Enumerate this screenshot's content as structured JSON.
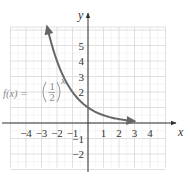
{
  "chart_data": {
    "type": "line",
    "title": "",
    "xlabel": "x",
    "ylabel": "y",
    "xlim": [
      -5,
      5
    ],
    "ylim": [
      -3,
      6
    ],
    "grid": true,
    "x_ticks": [
      -4,
      -3,
      -2,
      -1,
      1,
      2,
      3,
      4
    ],
    "x_tick_labels": [
      "−4",
      "−3",
      "−2",
      "−1",
      "1",
      "2",
      "3",
      "4"
    ],
    "y_ticks": [
      -2,
      -1,
      2,
      3,
      4,
      5
    ],
    "y_tick_labels": [
      "−2",
      "−1",
      "2",
      "3",
      "4",
      "5"
    ],
    "series": [
      {
        "name": "f(x) = (1/2)^x",
        "function": "(1/2)^x",
        "x": [
          -2.5,
          -2,
          -1.5,
          -1,
          -0.5,
          0,
          0.5,
          1,
          1.5,
          2,
          2.5,
          3
        ],
        "values": [
          5.66,
          4,
          2.83,
          2,
          1.41,
          1,
          0.71,
          0.5,
          0.35,
          0.25,
          0.18,
          0.125
        ],
        "color": "#666666",
        "arrows": "both"
      }
    ],
    "annotations": [
      {
        "text": "f(x) = (1/2)^x",
        "position": "left of curve near y=2"
      }
    ]
  },
  "labels": {
    "x_axis": "x",
    "y_axis": "y",
    "function_label_prefix": "f(x) =",
    "function_base_num": "1",
    "function_base_den": "2",
    "function_exponent": "x"
  },
  "ticks": {
    "x": [
      {
        "label": "−4",
        "pos": 26
      },
      {
        "label": "−3",
        "pos": 41.5
      },
      {
        "label": "−2",
        "pos": 57
      },
      {
        "label": "−1",
        "pos": 72.5
      },
      {
        "label": "1",
        "pos": 103.5
      },
      {
        "label": "2",
        "pos": 119
      },
      {
        "label": "3",
        "pos": 134.5
      },
      {
        "label": "4",
        "pos": 150
      }
    ],
    "y": [
      {
        "label": "5",
        "pos": 45.5
      },
      {
        "label": "4",
        "pos": 61
      },
      {
        "label": "3",
        "pos": 76.5
      },
      {
        "label": "2",
        "pos": 92
      },
      {
        "label": "−1",
        "pos": 138.5
      },
      {
        "label": "−2",
        "pos": 154
      }
    ]
  },
  "colors": {
    "curve": "#666666",
    "axis": "#333333",
    "grid_major": "#d8d8d8",
    "grid_minor": "#eeeeee",
    "function_label": "#8a8a8a"
  }
}
